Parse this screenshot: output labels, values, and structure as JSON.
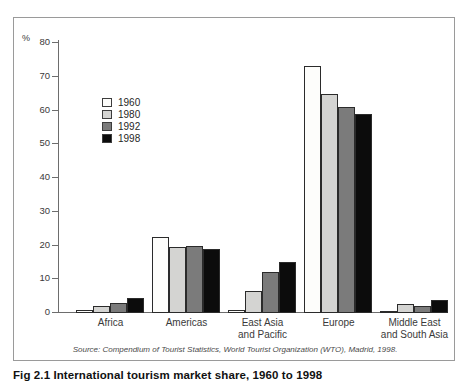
{
  "figure": {
    "caption": "Fig 2.1  International tourism market share, 1960 to 1998",
    "source_note": "Source: Compendium of Tourist Statistics, World Tourist Organization (WTO), Madrid, 1998."
  },
  "axis": {
    "unit_label": "%",
    "ticks": [
      "80",
      "70",
      "60",
      "50",
      "40",
      "30",
      "20",
      "10",
      "0"
    ]
  },
  "legend": {
    "items": [
      {
        "label": "1960",
        "color": "#fdfdfb"
      },
      {
        "label": "1980",
        "color": "#d4d4d2"
      },
      {
        "label": "1992",
        "color": "#7b7b7b"
      },
      {
        "label": "1998",
        "color": "#0c0c0c"
      }
    ]
  },
  "categories": [
    {
      "line1": "Africa",
      "line2": ""
    },
    {
      "line1": "Americas",
      "line2": ""
    },
    {
      "line1": "East Asia",
      "line2": "and Pacific"
    },
    {
      "line1": "Europe",
      "line2": ""
    },
    {
      "line1": "Middle East",
      "line2": "and South Asia"
    }
  ],
  "chart_data": {
    "type": "bar",
    "title": "Fig 2.1  International tourism market share, 1960 to 1998",
    "xlabel": "",
    "ylabel": "%",
    "ylim": [
      0,
      80
    ],
    "ytick_step": 10,
    "grid": false,
    "legend_position": "inside-upper-left",
    "categories": [
      "Africa",
      "Americas",
      "East Asia and Pacific",
      "Europe",
      "Middle East and South Asia"
    ],
    "series": [
      {
        "name": "1960",
        "color": "#fdfdfb",
        "values": [
          1.0,
          22.5,
          1.0,
          73.3,
          0.6
        ]
      },
      {
        "name": "1980",
        "color": "#d4d4d2",
        "values": [
          2.0,
          19.7,
          6.5,
          65.0,
          2.8
        ]
      },
      {
        "name": "1992",
        "color": "#7b7b7b",
        "values": [
          3.0,
          19.8,
          12.3,
          61.0,
          2.0
        ]
      },
      {
        "name": "1998",
        "color": "#0c0c0c",
        "values": [
          4.5,
          19.0,
          15.0,
          59.0,
          4.0
        ]
      }
    ],
    "annotations": [
      "Source: Compendium of Tourist Statistics, World Tourist Organization (WTO), Madrid, 1998."
    ]
  }
}
